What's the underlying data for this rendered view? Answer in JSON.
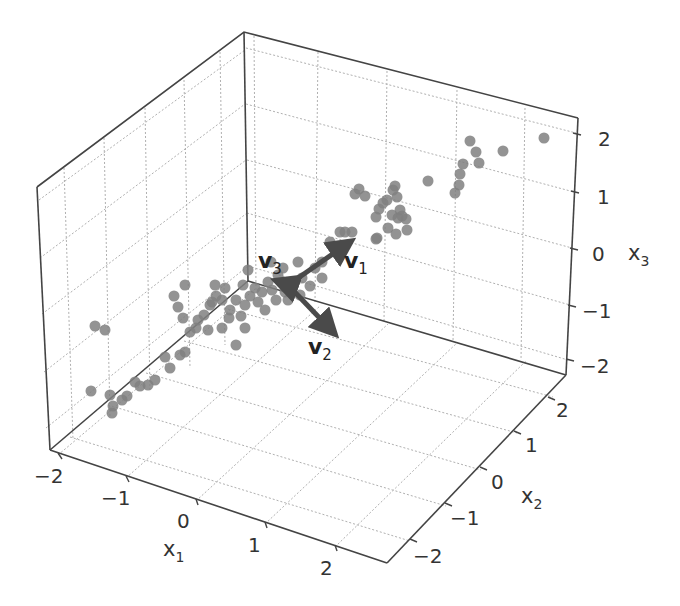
{
  "chart_data": {
    "type": "scatter3d",
    "title": "",
    "xlabel": "x1",
    "ylabel": "x2",
    "zlabel": "x3",
    "axes": {
      "x1": {
        "label": "x",
        "sub": "1",
        "ticks": [
          "−2",
          "−1",
          "0",
          "1",
          "2"
        ],
        "range": [
          -2.2,
          2.5
        ]
      },
      "x2": {
        "label": "x",
        "sub": "2",
        "ticks": [
          "−2",
          "−1",
          "0",
          "1",
          "2"
        ],
        "range": [
          -2.5,
          2.5
        ]
      },
      "x3": {
        "label": "x",
        "sub": "3",
        "ticks": [
          "2",
          "1",
          "0",
          "−1",
          "−2"
        ],
        "range": [
          -2.2,
          2.3
        ]
      }
    },
    "grid": true,
    "point_color": "#808080",
    "vector_color": "#555555",
    "vectors": [
      {
        "name": "v",
        "sub": "1",
        "description": "first principal direction, along data spread"
      },
      {
        "name": "v",
        "sub": "2",
        "description": "second principal direction"
      },
      {
        "name": "v",
        "sub": "3",
        "description": "third principal direction"
      }
    ],
    "points_screen": [
      [
        544,
        138
      ],
      [
        470,
        141
      ],
      [
        476,
        152
      ],
      [
        479,
        163
      ],
      [
        503,
        151
      ],
      [
        463,
        164
      ],
      [
        460,
        174
      ],
      [
        459,
        185
      ],
      [
        455,
        193
      ],
      [
        428,
        181
      ],
      [
        395,
        186
      ],
      [
        397,
        197
      ],
      [
        400,
        210
      ],
      [
        398,
        218
      ],
      [
        392,
        215
      ],
      [
        406,
        219
      ],
      [
        407,
        230
      ],
      [
        388,
        228
      ],
      [
        377,
        238
      ],
      [
        396,
        234
      ],
      [
        359,
        189
      ],
      [
        355,
        194
      ],
      [
        365,
        196
      ],
      [
        376,
        217
      ],
      [
        383,
        203
      ],
      [
        379,
        209
      ],
      [
        393,
        190
      ],
      [
        387,
        200
      ],
      [
        340,
        232
      ],
      [
        345,
        232
      ],
      [
        352,
        232
      ],
      [
        376,
        239
      ],
      [
        402,
        216
      ],
      [
        330,
        242
      ],
      [
        322,
        262
      ],
      [
        322,
        278
      ],
      [
        302,
        278
      ],
      [
        310,
        286
      ],
      [
        315,
        268
      ],
      [
        298,
        262
      ],
      [
        283,
        268
      ],
      [
        271,
        262
      ],
      [
        278,
        275
      ],
      [
        268,
        282
      ],
      [
        272,
        290
      ],
      [
        285,
        292
      ],
      [
        292,
        288
      ],
      [
        300,
        295
      ],
      [
        288,
        300
      ],
      [
        276,
        300
      ],
      [
        262,
        292
      ],
      [
        255,
        288
      ],
      [
        250,
        296
      ],
      [
        258,
        302
      ],
      [
        265,
        310
      ],
      [
        248,
        270
      ],
      [
        243,
        285
      ],
      [
        236,
        300
      ],
      [
        245,
        305
      ],
      [
        230,
        310
      ],
      [
        222,
        300
      ],
      [
        212,
        302
      ],
      [
        216,
        296
      ],
      [
        204,
        315
      ],
      [
        198,
        320
      ],
      [
        178,
        307
      ],
      [
        183,
        318
      ],
      [
        196,
        328
      ],
      [
        190,
        332
      ],
      [
        210,
        305
      ],
      [
        229,
        318
      ],
      [
        245,
        328
      ],
      [
        236,
        345
      ],
      [
        222,
        328
      ],
      [
        208,
        330
      ],
      [
        185,
        352
      ],
      [
        180,
        355
      ],
      [
        165,
        357
      ],
      [
        170,
        368
      ],
      [
        155,
        380
      ],
      [
        148,
        385
      ],
      [
        135,
        382
      ],
      [
        140,
        386
      ],
      [
        127,
        396
      ],
      [
        122,
        400
      ],
      [
        110,
        395
      ],
      [
        113,
        406
      ],
      [
        112,
        413
      ],
      [
        91,
        391
      ],
      [
        185,
        285
      ],
      [
        95,
        326
      ],
      [
        105,
        330
      ],
      [
        174,
        296
      ],
      [
        215,
        285
      ],
      [
        225,
        288
      ],
      [
        241,
        316
      ]
    ]
  },
  "axis_titles": {
    "x1": {
      "base": "x",
      "sub": "1"
    },
    "x2": {
      "base": "x",
      "sub": "2"
    },
    "x3": {
      "base": "x",
      "sub": "3"
    }
  },
  "ticks": {
    "x1": [
      "−2",
      "−1",
      "0",
      "1",
      "2"
    ],
    "x2": [
      "−2",
      "−1",
      "0",
      "1",
      "2"
    ],
    "x3": [
      "2",
      "1",
      "0",
      "−1",
      "−2"
    ]
  },
  "vectors": {
    "v1": {
      "base": "v",
      "sub": "1"
    },
    "v2": {
      "base": "v",
      "sub": "2"
    },
    "v3": {
      "base": "v",
      "sub": "3"
    }
  }
}
